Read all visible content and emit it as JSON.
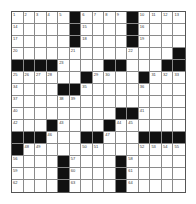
{
  "puzzle": {
    "rows": 15,
    "cols": 15,
    "colors": {
      "block": "#111111",
      "cell": "#ffffff",
      "grid_line": "#8a8a8a",
      "number": "#333333"
    },
    "layout": [
      ".....#....#....",
      ".....#....#....",
      ".....#....#....",
      "..............#",
      "####....##...##",
      "......#....#...",
      "....##.........",
      "...............",
      ".........##....",
      "...#....#......",
      "###...##...####",
      "#..............",
      "....#....#.....",
      "....#....#.....",
      "....#....#....."
    ],
    "numbers": [
      {
        "r": 0,
        "c": 0,
        "n": "1"
      },
      {
        "r": 0,
        "c": 1,
        "n": "2"
      },
      {
        "r": 0,
        "c": 2,
        "n": "3"
      },
      {
        "r": 0,
        "c": 3,
        "n": "4"
      },
      {
        "r": 0,
        "c": 4,
        "n": "5"
      },
      {
        "r": 0,
        "c": 6,
        "n": "6"
      },
      {
        "r": 0,
        "c": 7,
        "n": "7"
      },
      {
        "r": 0,
        "c": 8,
        "n": "8"
      },
      {
        "r": 0,
        "c": 9,
        "n": "9"
      },
      {
        "r": 0,
        "c": 11,
        "n": "10"
      },
      {
        "r": 0,
        "c": 12,
        "n": "11"
      },
      {
        "r": 0,
        "c": 13,
        "n": "12"
      },
      {
        "r": 0,
        "c": 14,
        "n": "13"
      },
      {
        "r": 1,
        "c": 0,
        "n": "14"
      },
      {
        "r": 1,
        "c": 6,
        "n": "15"
      },
      {
        "r": 1,
        "c": 11,
        "n": "16"
      },
      {
        "r": 2,
        "c": 0,
        "n": "17"
      },
      {
        "r": 2,
        "c": 6,
        "n": "18"
      },
      {
        "r": 2,
        "c": 11,
        "n": "19"
      },
      {
        "r": 3,
        "c": 0,
        "n": "20"
      },
      {
        "r": 3,
        "c": 5,
        "n": "21"
      },
      {
        "r": 3,
        "c": 10,
        "n": "22"
      },
      {
        "r": 4,
        "c": 4,
        "n": "23"
      },
      {
        "r": 4,
        "c": 9,
        "n": "24"
      },
      {
        "r": 5,
        "c": 0,
        "n": "25"
      },
      {
        "r": 5,
        "c": 1,
        "n": "26"
      },
      {
        "r": 5,
        "c": 2,
        "n": "27"
      },
      {
        "r": 5,
        "c": 3,
        "n": "28"
      },
      {
        "r": 5,
        "c": 7,
        "n": "29"
      },
      {
        "r": 5,
        "c": 8,
        "n": "30"
      },
      {
        "r": 5,
        "c": 12,
        "n": "31"
      },
      {
        "r": 5,
        "c": 13,
        "n": "32"
      },
      {
        "r": 5,
        "c": 14,
        "n": "33"
      },
      {
        "r": 6,
        "c": 0,
        "n": "34"
      },
      {
        "r": 6,
        "c": 6,
        "n": "35"
      },
      {
        "r": 6,
        "c": 11,
        "n": "36"
      },
      {
        "r": 7,
        "c": 0,
        "n": "37"
      },
      {
        "r": 7,
        "c": 4,
        "n": "38"
      },
      {
        "r": 7,
        "c": 5,
        "n": "39"
      },
      {
        "r": 8,
        "c": 0,
        "n": "40"
      },
      {
        "r": 8,
        "c": 11,
        "n": "41"
      },
      {
        "r": 9,
        "c": 0,
        "n": "42"
      },
      {
        "r": 9,
        "c": 4,
        "n": "43"
      },
      {
        "r": 9,
        "c": 9,
        "n": "44"
      },
      {
        "r": 9,
        "c": 10,
        "n": "45"
      },
      {
        "r": 10,
        "c": 3,
        "n": "46"
      },
      {
        "r": 10,
        "c": 8,
        "n": "47"
      },
      {
        "r": 11,
        "c": 1,
        "n": "48"
      },
      {
        "r": 11,
        "c": 2,
        "n": "49"
      },
      {
        "r": 11,
        "c": 6,
        "n": "50"
      },
      {
        "r": 11,
        "c": 7,
        "n": "51"
      },
      {
        "r": 11,
        "c": 11,
        "n": "52"
      },
      {
        "r": 11,
        "c": 12,
        "n": "53"
      },
      {
        "r": 11,
        "c": 13,
        "n": "54"
      },
      {
        "r": 11,
        "c": 14,
        "n": "55"
      },
      {
        "r": 12,
        "c": 0,
        "n": "56"
      },
      {
        "r": 12,
        "c": 5,
        "n": "57"
      },
      {
        "r": 12,
        "c": 10,
        "n": "58"
      },
      {
        "r": 13,
        "c": 0,
        "n": "59"
      },
      {
        "r": 13,
        "c": 5,
        "n": "60"
      },
      {
        "r": 13,
        "c": 10,
        "n": "61"
      },
      {
        "r": 14,
        "c": 0,
        "n": "62"
      },
      {
        "r": 14,
        "c": 5,
        "n": "63"
      },
      {
        "r": 14,
        "c": 10,
        "n": "64"
      }
    ]
  }
}
